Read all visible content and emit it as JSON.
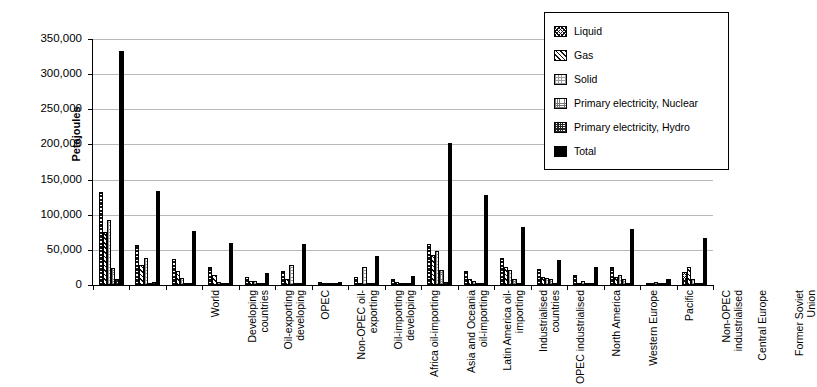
{
  "chart_data": {
    "type": "bar",
    "title": "",
    "xlabel": "",
    "ylabel": "Petajoules",
    "ylim": [
      0,
      350000
    ],
    "ytick_labels": [
      "0",
      "50,000",
      "100,000",
      "150,000",
      "200,000",
      "250,000",
      "300,000",
      "350,000"
    ],
    "ytick_values": [
      0,
      50000,
      100000,
      150000,
      200000,
      250000,
      300000,
      350000
    ],
    "grid": true,
    "legend_position": "top-right",
    "categories": [
      "World",
      "Developing countries",
      "Oil-exporting developing",
      "OPEC",
      "Non-OPEC oil-exporting",
      "Oil-importing developing",
      "Africa oil-importing",
      "Asia and Oceania oil-importing",
      "Latin America oil-importing",
      "Industrialised countries",
      "OPEC industrialised",
      "North America",
      "Western Europe",
      "Pacific",
      "Non-OPEC industrialised",
      "Central Europe",
      "Former Soviet Union"
    ],
    "series": [
      {
        "name": "Liquid",
        "values": [
          133000,
          57000,
          37000,
          25000,
          12000,
          20000,
          4000,
          11000,
          9000,
          58000,
          20000,
          38000,
          23000,
          14000,
          25000,
          3000,
          18000
        ]
      },
      {
        "name": "Gas",
        "values": [
          75000,
          28000,
          20000,
          14000,
          6000,
          8000,
          1000,
          3000,
          4000,
          42000,
          9000,
          25000,
          11000,
          3000,
          12000,
          2000,
          25000
        ]
      },
      {
        "name": "Solid",
        "values": [
          92000,
          38000,
          10000,
          4000,
          6000,
          28000,
          1000,
          26000,
          2000,
          48000,
          6000,
          22000,
          10000,
          6000,
          14000,
          5000,
          9000
        ]
      },
      {
        "name": "Primary electricity, Nuclear",
        "values": [
          24000,
          3000,
          1000,
          0,
          1000,
          2000,
          0,
          1000,
          1000,
          21000,
          1000,
          8000,
          9000,
          3000,
          8000,
          1000,
          3000
        ]
      },
      {
        "name": "Primary electricity, Hydro",
        "values": [
          9000,
          5000,
          2000,
          1000,
          1000,
          3000,
          0,
          1000,
          2000,
          4000,
          1000,
          2000,
          2000,
          1000,
          2000,
          0,
          1000
        ]
      },
      {
        "name": "Total",
        "values": [
          333000,
          134000,
          77000,
          60000,
          17000,
          58000,
          5000,
          41000,
          13000,
          202000,
          128000,
          83000,
          35000,
          26000,
          79000,
          8000,
          67000
        ]
      }
    ]
  },
  "legend": {
    "items": [
      {
        "label": "Liquid",
        "pattern": "p-liquid"
      },
      {
        "label": "Gas",
        "pattern": "p-gas"
      },
      {
        "label": "Solid",
        "pattern": "p-solid"
      },
      {
        "label": "Primary electricity, Nuclear",
        "pattern": "p-nuclear"
      },
      {
        "label": "Primary electricity, Hydro",
        "pattern": "p-hydro"
      },
      {
        "label": "Total",
        "pattern": "p-total"
      }
    ]
  }
}
